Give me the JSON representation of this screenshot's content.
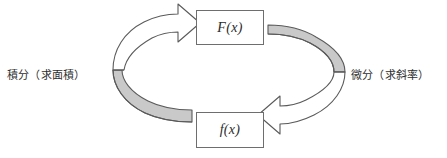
{
  "diagram": {
    "type": "cycle",
    "title": "",
    "nodes": [
      {
        "id": "Fx",
        "label": "F(x)",
        "position": "top"
      },
      {
        "id": "fx",
        "label": "f(x)",
        "position": "bottom"
      }
    ],
    "edges": [
      {
        "id": "left-arrow",
        "label": "積分（求面積）",
        "label_position": "left",
        "from": "fx",
        "to": "Fx",
        "direction": "counterclockwise-up",
        "style": "curved-3d-block-arrow"
      },
      {
        "id": "right-arrow",
        "label": "微分（求斜率）",
        "label_position": "right",
        "from": "Fx",
        "to": "fx",
        "direction": "clockwise-down",
        "style": "curved-3d-block-arrow"
      }
    ],
    "colors": {
      "ribbon_fill": "#c9c9c9",
      "ribbon_shadow": "#9a9a9a",
      "arrow_head_fill": "#ffffff",
      "outline": "#5a5a5a",
      "box_border": "#6e6e6e",
      "box_fill": "#ffffff",
      "text": "#2b2b2b",
      "background": "#ffffff"
    }
  },
  "icons": {
    "left_arrow_icon": "curved-arrow-up-icon",
    "right_arrow_icon": "curved-arrow-down-icon"
  }
}
